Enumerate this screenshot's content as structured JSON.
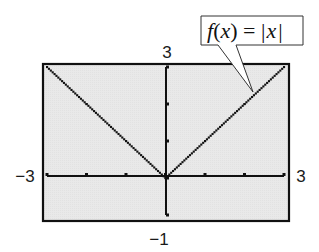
{
  "chart_data": {
    "type": "line",
    "title": "",
    "function": "f(x) = |x|",
    "series": [
      {
        "name": "f(x) = |x|",
        "x": [
          -3,
          -2,
          -1,
          0,
          1,
          2,
          3
        ],
        "values": [
          3,
          2,
          1,
          0,
          1,
          2,
          3
        ],
        "style": "dotted"
      }
    ],
    "xlabel": "",
    "ylabel": "",
    "xlim": [
      -3,
      3
    ],
    "ylim": [
      -1,
      3
    ],
    "xscale_ticks": [
      -3,
      -2,
      -1,
      0,
      1,
      2,
      3
    ],
    "yscale_ticks": [
      -1,
      0,
      1,
      2,
      3
    ],
    "grid": false,
    "legend": "none",
    "window_labels": {
      "xmin": "−3",
      "xmax": "3",
      "ymin": "−1",
      "ymax": "3"
    },
    "annotation": {
      "label_prefix": "f",
      "label_open": "(",
      "label_var": "x",
      "label_close": ")",
      "label_eq": " = ",
      "label_bar_left": "|",
      "label_abs_var": "x",
      "label_bar_right": "|",
      "full_text": "f(x) = |x|",
      "points_to": [
        2.2,
        2.2
      ]
    }
  },
  "colors": {
    "plot_background": "#e8e8e8",
    "frame": "#111111",
    "axis": "#111111",
    "curve": "#111111",
    "callout_border": "#333333",
    "callout_fill": "#ffffff"
  }
}
